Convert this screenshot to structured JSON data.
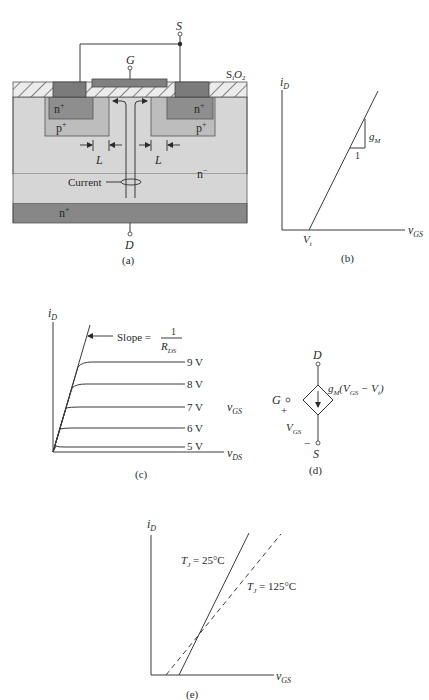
{
  "panel_a": {
    "caption": "(a)",
    "terminal_source": "S",
    "terminal_gate": "G",
    "terminal_drain": "D",
    "oxide_label_main": "S",
    "oxide_label_sub1": "i",
    "oxide_label_O": "O",
    "oxide_label_sub2": "2",
    "left_nplus": "n",
    "left_nplus_sup": "+",
    "right_nplus": "n",
    "right_nplus_sup": "+",
    "left_pplus": "p",
    "left_pplus_sup": "+",
    "right_pplus": "p",
    "right_pplus_sup": "+",
    "drift_region": "n",
    "drift_region_sup": "−",
    "substrate": "n",
    "substrate_sup": "+",
    "channel_length_left": "L",
    "channel_length_right": "L",
    "current_label": "Current",
    "colors": {
      "oxide_fill": "#e4e4e4",
      "metal": "#7b7b7b",
      "gate": "#808080",
      "nplus": "#8e8e8e",
      "pplus": "#bdbdbd",
      "drift": "#d6d6d6",
      "substrate": "#878787"
    }
  },
  "panel_b": {
    "caption": "(b)",
    "y_axis": "i",
    "y_axis_sub": "D",
    "x_axis": "v",
    "x_axis_sub": "GS",
    "threshold": "V",
    "threshold_sub": "t",
    "slope_label": "g",
    "slope_label_sub": "M",
    "slope_run": "1"
  },
  "panel_c": {
    "caption": "(c)",
    "y_axis": "i",
    "y_axis_sub": "D",
    "x_axis": "v",
    "x_axis_sub": "DS",
    "param_label": "v",
    "param_label_sub": "GS",
    "slope_text": "Slope =",
    "slope_num": "1",
    "slope_den": "R",
    "slope_den_sub": "DS",
    "curves": [
      "9 V",
      "8 V",
      "7 V",
      "6 V",
      "5 V"
    ]
  },
  "panel_d": {
    "caption": "(d)",
    "drain": "D",
    "gate": "G",
    "source": "S",
    "plus": "+",
    "minus": "−",
    "vgs": "V",
    "vgs_sub": "GS",
    "source_expr_g": "g",
    "source_expr_g_sub": "M",
    "source_expr_open": "(V",
    "source_expr_open_sub": "GS",
    "source_expr_mid": " − V",
    "source_expr_mid_sub": "t",
    "source_expr_close": ")"
  },
  "panel_e": {
    "caption": "(e)",
    "y_axis": "i",
    "y_axis_sub": "D",
    "x_axis": "v",
    "x_axis_sub": "GS",
    "curve_25_T": "T",
    "curve_25_T_sub": "J",
    "curve_25_val": " = 25°C",
    "curve_125_T": "T",
    "curve_125_T_sub": "J",
    "curve_125_val": " = 125°C"
  }
}
